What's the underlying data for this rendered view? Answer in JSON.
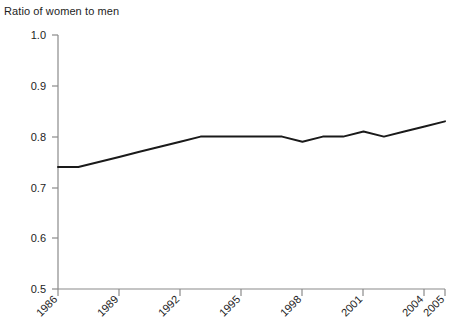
{
  "chart_data": {
    "type": "line",
    "title": "Ratio of women to men",
    "xlabel": "",
    "ylabel": "",
    "ylim": [
      0.5,
      1.0
    ],
    "xlim": [
      1986,
      2005
    ],
    "grid": false,
    "legend": null,
    "y_ticks": [
      "1.0",
      "0.9",
      "0.8",
      "0.7",
      "0.6",
      "0.5"
    ],
    "y_tick_values": [
      1.0,
      0.9,
      0.8,
      0.7,
      0.6,
      0.5
    ],
    "x_ticks": [
      "1986",
      "1989",
      "1992",
      "1995",
      "1998",
      "2001",
      "2004",
      "2005"
    ],
    "x_tick_values": [
      1986,
      1989,
      1992,
      1995,
      1998,
      2001,
      2004,
      2005
    ],
    "series": [
      {
        "name": "Ratio of women to men",
        "color": "#1a1a1a",
        "x": [
          1986,
          1987,
          1988,
          1989,
          1990,
          1991,
          1992,
          1993,
          1994,
          1995,
          1996,
          1997,
          1998,
          1999,
          2000,
          2001,
          2002,
          2003,
          2004,
          2005
        ],
        "values": [
          0.74,
          0.74,
          0.75,
          0.76,
          0.77,
          0.78,
          0.79,
          0.8,
          0.8,
          0.8,
          0.8,
          0.8,
          0.79,
          0.8,
          0.8,
          0.81,
          0.8,
          0.81,
          0.82,
          0.83
        ]
      }
    ]
  },
  "axes": {
    "y_axis_name": "ratio-axis",
    "x_axis_name": "year-axis"
  }
}
